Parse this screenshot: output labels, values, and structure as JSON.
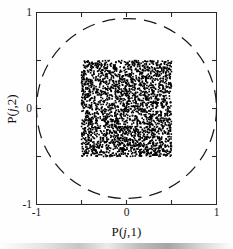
{
  "figure": {
    "title": "",
    "background_color": "#ffffff",
    "axis_color": "#2a2a2a",
    "marker_color": "#000000",
    "circle_color": "#1a1a1a"
  },
  "axes": {
    "xlabel": "P(j,1)",
    "xlabel_prefix": "P(",
    "xlabel_var": "j",
    "xlabel_suffix": ",1)",
    "ylabel": "P(j,2)",
    "ylabel_prefix": "P(",
    "ylabel_var": "j",
    "ylabel_suffix": ",2)",
    "xticks": [
      "-1",
      "0",
      "1"
    ],
    "xtick_values": [
      -1,
      0,
      1
    ],
    "yticks": [
      "1",
      "0",
      "-1"
    ],
    "ytick_values": [
      1,
      0,
      -1
    ],
    "xlim": [
      -1,
      1
    ],
    "ylim": [
      -1,
      1
    ],
    "minor_tick_values": [
      -0.5,
      0.5
    ],
    "grid": "off",
    "legend": "none"
  },
  "chart_data": {
    "type": "scatter",
    "title": "",
    "xlabel": "P(j,1)",
    "ylabel": "P(j,2)",
    "xlim": [
      -1,
      1
    ],
    "ylim": [
      -1,
      1
    ],
    "grid": false,
    "legend_position": "none",
    "series": [
      {
        "name": "sample points",
        "marker": "square",
        "marker_size_px": 1.6,
        "color": "#000000",
        "n_points": 2600,
        "x_range": [
          -0.5,
          0.5
        ],
        "y_range": [
          -0.5,
          0.5
        ],
        "distribution": "uniform-square",
        "description": "Dense uniform cloud of points filling the square region from -0.5 to 0.5 on both axes"
      }
    ],
    "annotations": [
      {
        "type": "circle",
        "name": "unit-circle",
        "center": [
          0,
          0
        ],
        "radius": 1,
        "linestyle": "dashed",
        "color": "#1a1a1a",
        "description": "Dashed unit circle inscribed in the square axes, tangent to all four axis borders"
      }
    ]
  },
  "seed": 20240517
}
